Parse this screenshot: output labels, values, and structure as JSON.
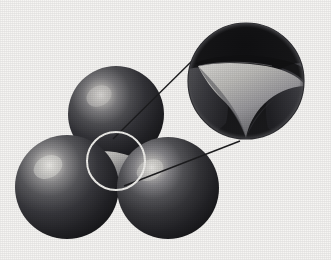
{
  "figure": {
    "title": "Close-packed spheres with magnified interstitial void",
    "background_color": "#f6f5f3"
  },
  "canvas": {
    "width": 331,
    "height": 260
  },
  "spheres": [
    {
      "id": "sphere-top",
      "label": "Top sphere",
      "cx": 116,
      "cy": 114,
      "r": 48,
      "highlight_x": 99,
      "highlight_y": 96,
      "base_color": "#2a2a2c",
      "mid_color": "#555559",
      "highlight_color": "#d7d6d4",
      "shadow_color": "#131314"
    },
    {
      "id": "sphere-left",
      "label": "Lower-left sphere",
      "cx": 67,
      "cy": 187,
      "r": 52,
      "highlight_x": 48,
      "highlight_y": 167,
      "base_color": "#2a2a2c",
      "mid_color": "#5a5a5e",
      "highlight_color": "#e3e2e0",
      "shadow_color": "#121213"
    },
    {
      "id": "sphere-right",
      "label": "Lower-right sphere",
      "cx": 168,
      "cy": 188,
      "r": 51,
      "highlight_x": 150,
      "highlight_y": 170,
      "base_color": "#2a2a2c",
      "mid_color": "#56565a",
      "highlight_color": "#dddcda",
      "shadow_color": "#121213"
    }
  ],
  "marker_circle": {
    "id": "void-marker",
    "label": "Interstitial void marker",
    "cx": 116,
    "cy": 161,
    "r": 29,
    "stroke_color": "#f0efec",
    "stroke_width": 2
  },
  "magnifier": {
    "id": "magnified-detail",
    "label": "Magnified interstitial void",
    "cx": 246,
    "cy": 81,
    "r": 58,
    "rim_color": "#4a4a4e",
    "dark_fill": "#141416",
    "void_fill": "#b9b8b5",
    "void_shadow": "#6f6f72",
    "surface_fill": "#3a3a3e"
  },
  "leader_lines": [
    {
      "id": "leader-line-upper",
      "label": "Upper leader line",
      "x1": 113,
      "y1": 139,
      "x2": 199,
      "y2": 54,
      "color": "#1c1c1e",
      "width": 1.4
    },
    {
      "id": "leader-line-lower",
      "label": "Lower leader line",
      "x1": 124,
      "y1": 186,
      "x2": 240,
      "y2": 141,
      "color": "#1c1c1e",
      "width": 1.4
    }
  ],
  "palette": {
    "background": "#f6f5f3",
    "sphere_dark": "#2a2a2c",
    "sphere_highlight": "#e3e2e0",
    "void_light": "#b9b8b5",
    "line": "#1c1c1e",
    "marker_stroke": "#f0efec"
  }
}
